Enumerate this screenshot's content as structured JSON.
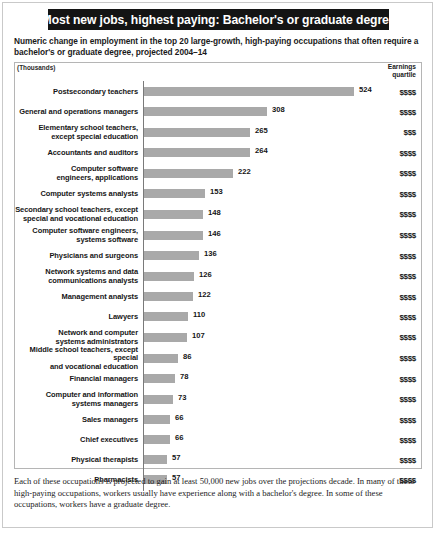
{
  "title": "Most new jobs, highest paying: Bachelor's or graduate degree",
  "subtitle": "Numeric change in employment in the top 20 large-growth, high-paying occupations that often require a bachelor's or graduate degree, projected 2004–14",
  "units_label": "(Thousands)",
  "earnings_header_line1": "Earnings",
  "earnings_header_line2": "quartile",
  "footnote": "Each of these occupations is projected to gain at least 50,000 new jobs over the projections decade. In many of these high-paying occupations, workers usually have experience along with a bachelor's degree. In some of these occupations, workers have a graduate degree.",
  "colors": {
    "title_band": "#141414",
    "title_text": "#ffffff",
    "bar": "#a9a9a9",
    "axis": "#7a7a7a",
    "frame": "#b5b5b5"
  },
  "chart_data": {
    "type": "bar",
    "orientation": "horizontal",
    "title": "Most new jobs, highest paying: Bachelor's or graduate degree",
    "subtitle": "Numeric change in employment in the top 20 large-growth, high-paying occupations that often require a bachelor's or graduate degree, projected 2004–14",
    "xlabel": "(Thousands)",
    "ylabel": "",
    "xlim": [
      0,
      524
    ],
    "grid": false,
    "legend": "none",
    "categories": [
      "Postsecondary teachers",
      "General and operations managers",
      "Elementary school teachers, except special education",
      "Accountants and auditors",
      "Computer software engineers, applications",
      "Computer systems analysts",
      "Secondary school teachers, except special and vocational education",
      "Computer software engineers, systems software",
      "Physicians and surgeons",
      "Network systems and data communications analysts",
      "Management analysts",
      "Lawyers",
      "Network and computer systems administrators",
      "Middle school teachers, except special and vocational education",
      "Financial managers",
      "Computer and information systems managers",
      "Sales managers",
      "Chief executives",
      "Physical therapists",
      "Pharmacists"
    ],
    "values": [
      524,
      308,
      265,
      264,
      222,
      153,
      148,
      146,
      136,
      126,
      122,
      110,
      107,
      86,
      78,
      73,
      66,
      66,
      57,
      57
    ],
    "earnings_quartile": [
      "$$$$",
      "$$$$",
      "$$$",
      "$$$$",
      "$$$$",
      "$$$$",
      "$$$$",
      "$$$$",
      "$$$$",
      "$$$$",
      "$$$$",
      "$$$$",
      "$$$$",
      "$$$$",
      "$$$$",
      "$$$$",
      "$$$$",
      "$$$$",
      "$$$$",
      "$$$$"
    ]
  },
  "rows": [
    {
      "label_lines": [
        "Postsecondary teachers"
      ],
      "value": 524,
      "value_text": "524",
      "quartile": "$$$$"
    },
    {
      "label_lines": [
        "General and operations managers"
      ],
      "value": 308,
      "value_text": "308",
      "quartile": "$$$$"
    },
    {
      "label_lines": [
        "Elementary school teachers,",
        "except special education"
      ],
      "value": 265,
      "value_text": "265",
      "quartile": "$$$"
    },
    {
      "label_lines": [
        "Accountants and auditors"
      ],
      "value": 264,
      "value_text": "264",
      "quartile": "$$$$"
    },
    {
      "label_lines": [
        "Computer software",
        "engineers, applications"
      ],
      "value": 222,
      "value_text": "222",
      "quartile": "$$$$"
    },
    {
      "label_lines": [
        "Computer systems analysts"
      ],
      "value": 153,
      "value_text": "153",
      "quartile": "$$$$"
    },
    {
      "label_lines": [
        "Secondary school teachers, except",
        "special and vocational education"
      ],
      "value": 148,
      "value_text": "148",
      "quartile": "$$$$"
    },
    {
      "label_lines": [
        "Computer software engineers,",
        "systems software"
      ],
      "value": 146,
      "value_text": "146",
      "quartile": "$$$$"
    },
    {
      "label_lines": [
        "Physicians and surgeons"
      ],
      "value": 136,
      "value_text": "136",
      "quartile": "$$$$"
    },
    {
      "label_lines": [
        "Network systems and data",
        "communications analysts"
      ],
      "value": 126,
      "value_text": "126",
      "quartile": "$$$$"
    },
    {
      "label_lines": [
        "Management analysts"
      ],
      "value": 122,
      "value_text": "122",
      "quartile": "$$$$"
    },
    {
      "label_lines": [
        "Lawyers"
      ],
      "value": 110,
      "value_text": "110",
      "quartile": "$$$$"
    },
    {
      "label_lines": [
        "Network and computer",
        "systems administrators"
      ],
      "value": 107,
      "value_text": "107",
      "quartile": "$$$$"
    },
    {
      "label_lines": [
        "Middle school teachers, except special",
        "and vocational education"
      ],
      "value": 86,
      "value_text": "86",
      "quartile": "$$$$"
    },
    {
      "label_lines": [
        "Financial managers"
      ],
      "value": 78,
      "value_text": "78",
      "quartile": "$$$$"
    },
    {
      "label_lines": [
        "Computer and information",
        "systems managers"
      ],
      "value": 73,
      "value_text": "73",
      "quartile": "$$$$"
    },
    {
      "label_lines": [
        "Sales managers"
      ],
      "value": 66,
      "value_text": "66",
      "quartile": "$$$$"
    },
    {
      "label_lines": [
        "Chief executives"
      ],
      "value": 66,
      "value_text": "66",
      "quartile": "$$$$"
    },
    {
      "label_lines": [
        "Physical therapists"
      ],
      "value": 57,
      "value_text": "57",
      "quartile": "$$$$"
    },
    {
      "label_lines": [
        "Pharmacists"
      ],
      "value": 57,
      "value_text": "57",
      "quartile": "$$$$"
    }
  ]
}
